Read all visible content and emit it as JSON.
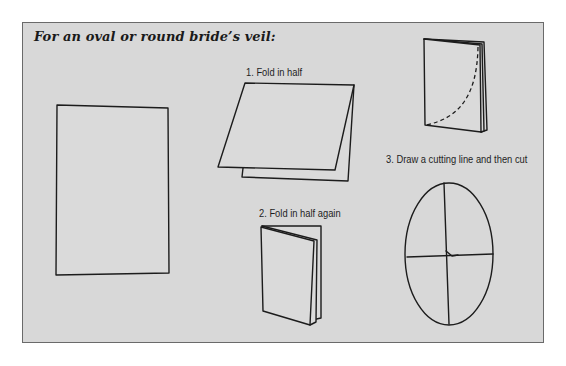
{
  "title": "For an oval or round bride’s veil:",
  "steps": [
    {
      "label": "1.  Fold in half"
    },
    {
      "label": "2.  Fold in half again"
    },
    {
      "label": "3.  Draw a cutting line and then cut"
    }
  ],
  "colors": {
    "panel_background": "#d8d8d8",
    "panel_border": "#6a6a6a",
    "line": "#1c1c1c"
  }
}
